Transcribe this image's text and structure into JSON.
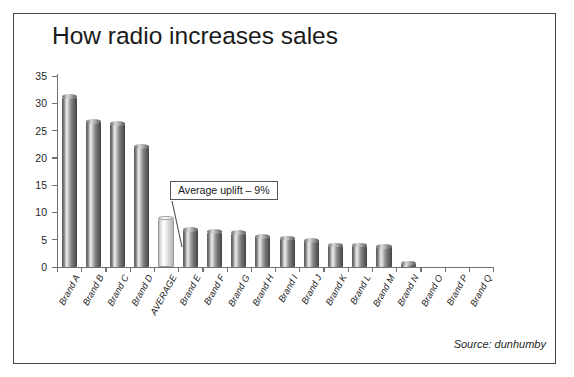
{
  "chart_data": {
    "type": "bar",
    "title": "How radio increases sales",
    "xlabel": "",
    "ylabel": "",
    "ylim": [
      0,
      35
    ],
    "ytick_step": 5,
    "yticks": [
      0,
      5,
      10,
      15,
      20,
      25,
      30,
      35
    ],
    "grid": false,
    "legend": null,
    "categories": [
      "Brand A",
      "Brand B",
      "Brand C",
      "Brand D",
      "AVERAGE",
      "Brand E",
      "Brand F",
      "Brand G",
      "Brand H",
      "Brand I",
      "Brand J",
      "Brand K",
      "Brand L",
      "Brand M",
      "Brand N",
      "Brand O",
      "Brand P",
      "Brand Q"
    ],
    "values": [
      31.2,
      26.7,
      26.3,
      22.1,
      9.0,
      6.9,
      6.5,
      6.3,
      5.6,
      5.3,
      4.9,
      4.0,
      4.0,
      3.8,
      0.7,
      0,
      0,
      0
    ],
    "highlight_index": 4,
    "annotations": [
      {
        "text": "Average uplift – 9%",
        "target_category": "AVERAGE",
        "target_value": 9.0
      }
    ],
    "source": "Source: dunhumby"
  },
  "colors": {
    "bar_dark": "#6e6e71",
    "bar_light": "#ededf0",
    "axis": "#6f6f74",
    "frame": "#444449",
    "text": "#1a1a1a"
  }
}
